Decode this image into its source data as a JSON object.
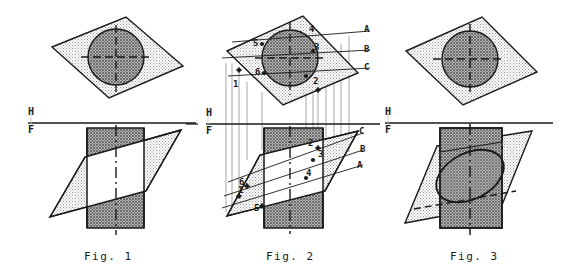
{
  "plate": {
    "title": "Cutting plane through a cylinder - orthographic projections",
    "background": "#ffffff",
    "width": 576,
    "height": 279
  },
  "colors": {
    "line": "#1a1a1a",
    "plane_fill": "#d9d9d9",
    "cylinder_fill": "#8c8c8c",
    "cut_fill": "#ffffff",
    "thin_line": "#555555",
    "text": "#1a1a1a"
  },
  "fold_line": {
    "above_label": "H",
    "below_label": "F",
    "description": "horizontal-frontal reference fold line"
  },
  "figures": [
    {
      "id": "fig1",
      "caption": "Fig. 1",
      "top_view": {
        "shape": "inclined plane shown as parallelogram with circle of cylinder",
        "center_lines": "dashed horizontal and vertical center lines"
      },
      "front_view": {
        "shape": "cylinder rectangle crossed by edge-view of cutting plane",
        "center_line": "dash-dot vertical axis"
      },
      "point_labels": [],
      "edge_labels": []
    },
    {
      "id": "fig2",
      "caption": "Fig. 2",
      "top_view": {
        "shape": "inclined plane parallelogram with circle, cutting lines A B C",
        "center_lines": "dashed horizontal and vertical center lines"
      },
      "front_view": {
        "shape": "cylinder rectangle with cutting plane and located points",
        "center_line": "dash-dot vertical axis"
      },
      "point_labels": [
        "1",
        "2",
        "3",
        "4",
        "5",
        "6"
      ],
      "edge_labels": [
        "A",
        "B",
        "C"
      ],
      "projector_lines": "vertical projectors transfer points from top view to front view"
    },
    {
      "id": "fig3",
      "caption": "Fig. 3",
      "top_view": {
        "shape": "inclined plane parallelogram with circle of cylinder",
        "center_lines": "dashed horizontal and vertical center lines"
      },
      "front_view": {
        "shape": "cylinder rectangle with elliptical section curve and hidden dashed edges",
        "center_line": "dash-dot vertical axis"
      },
      "point_labels": [],
      "edge_labels": []
    }
  ],
  "captions": {
    "fig1": "Fig. 1",
    "fig2": "Fig. 2",
    "fig3": "Fig. 3"
  },
  "fold_labels": {
    "fig1_h": "H",
    "fig1_f": "F",
    "fig2_h": "H",
    "fig2_f": "F",
    "fig3_h": "H",
    "fig3_f": "F"
  },
  "fig2_labels": {
    "top": {
      "n1": "1",
      "n2": "2",
      "n3": "3",
      "n4": "4",
      "n5": "5",
      "n6": "6",
      "a": "A",
      "b": "B",
      "c": "C"
    },
    "front": {
      "n1": "1",
      "n2": "2",
      "n3": "3",
      "n4": "4",
      "n5": "5",
      "n6": "6",
      "a": "A",
      "b": "B",
      "c": "C"
    }
  }
}
